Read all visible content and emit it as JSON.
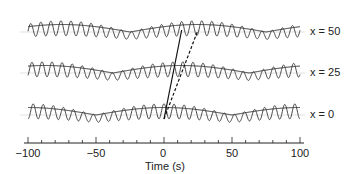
{
  "chart_data": {
    "type": "line",
    "title": "",
    "xlabel": "Time (s)",
    "ylabel": "",
    "xlim": [
      -100,
      100
    ],
    "xticks": [
      -100,
      -50,
      0,
      50,
      100
    ],
    "xtick_labels": [
      "−100",
      "−50",
      "0",
      "50",
      "100"
    ],
    "minor_tick_step": 10,
    "grid": false,
    "legend": null,
    "series": [
      {
        "name": "x = 0",
        "label": "x = 0",
        "carrier_period_s": 7.4,
        "envelope_peak_t": 0,
        "envelope_null_t": [
          -50,
          50
        ],
        "style": "solid"
      },
      {
        "name": "x = 25",
        "label": "x = 25",
        "carrier_period_s": 7.4,
        "envelope_peak_t": 12.5,
        "envelope_null_t": [
          -37.5,
          62.5
        ],
        "style": "solid"
      },
      {
        "name": "x = 50",
        "label": "x = 50",
        "carrier_period_s": 7.4,
        "envelope_peak_t": 25,
        "envelope_null_t": [
          -25,
          75
        ],
        "style": "solid"
      }
    ],
    "annotations": [
      {
        "type": "line",
        "style": "solid",
        "description": "phase velocity line",
        "from": {
          "t": 0,
          "trace": "x = 0"
        },
        "to": {
          "t": 13,
          "trace": "x = 50"
        }
      },
      {
        "type": "line",
        "style": "dashed",
        "description": "group velocity line",
        "from": {
          "t": 0,
          "trace": "x = 0"
        },
        "to": {
          "t": 25,
          "trace": "x = 50"
        }
      }
    ]
  },
  "labels": {
    "trace_top": "x = 50",
    "trace_mid": "x = 25",
    "trace_bot": "x = 0",
    "xaxis_title": "Time (s)",
    "ticks": [
      "−100",
      "−50",
      "0",
      "50",
      "100"
    ]
  }
}
